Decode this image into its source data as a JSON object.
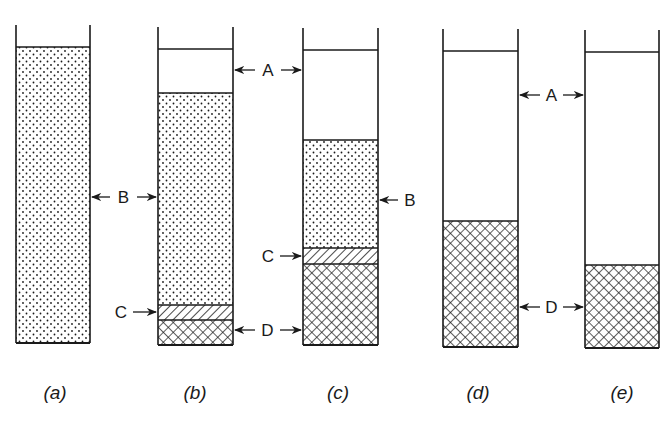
{
  "figure": {
    "colors": {
      "ink": "#1a1a1a",
      "background": "#ffffff"
    },
    "legend": {
      "A": "clear liquid",
      "B": "uniform suspension (dotted)",
      "C": "transition zone (diagonal hatch)",
      "D": "sediment / compacted layer (crosshatch)"
    },
    "columns": [
      {
        "caption": "(a)",
        "left": 16,
        "right": 90,
        "wall_top": 25,
        "liquid_top": 47,
        "bottom": 343,
        "layers": [
          {
            "zone": "B",
            "top": 47,
            "bottom": 343
          }
        ]
      },
      {
        "caption": "(b)",
        "left": 158,
        "right": 233,
        "wall_top": 27,
        "liquid_top": 49,
        "bottom": 345,
        "layers": [
          {
            "zone": "A",
            "top": 49,
            "bottom": 93
          },
          {
            "zone": "B",
            "top": 93,
            "bottom": 305
          },
          {
            "zone": "C",
            "top": 305,
            "bottom": 320
          },
          {
            "zone": "D",
            "top": 320,
            "bottom": 345
          }
        ]
      },
      {
        "caption": "(c)",
        "left": 303,
        "right": 378,
        "wall_top": 28,
        "liquid_top": 50,
        "bottom": 345,
        "layers": [
          {
            "zone": "A",
            "top": 50,
            "bottom": 140
          },
          {
            "zone": "B",
            "top": 140,
            "bottom": 248
          },
          {
            "zone": "C",
            "top": 248,
            "bottom": 264
          },
          {
            "zone": "D",
            "top": 264,
            "bottom": 345
          }
        ]
      },
      {
        "caption": "(d)",
        "left": 443,
        "right": 518,
        "wall_top": 29,
        "liquid_top": 51,
        "bottom": 347,
        "layers": [
          {
            "zone": "A",
            "top": 51,
            "bottom": 221
          },
          {
            "zone": "D",
            "top": 221,
            "bottom": 347
          }
        ]
      },
      {
        "caption": "(e)",
        "left": 585,
        "right": 659,
        "wall_top": 30,
        "liquid_top": 52,
        "bottom": 348,
        "layers": [
          {
            "zone": "A",
            "top": 52,
            "bottom": 265
          },
          {
            "zone": "D",
            "top": 265,
            "bottom": 348
          }
        ]
      }
    ],
    "annotations": [
      {
        "text": "B",
        "between": [
          "a",
          "b"
        ],
        "y": 197
      },
      {
        "text": "A",
        "between": [
          "b",
          "c"
        ],
        "y": 70
      },
      {
        "text": "C",
        "target": "b",
        "y": 312
      },
      {
        "text": "D",
        "between": [
          "b",
          "c"
        ],
        "y": 330
      },
      {
        "text": "B",
        "target": "c",
        "side": "right",
        "y": 200
      },
      {
        "text": "C",
        "target": "c",
        "y": 256
      },
      {
        "text": "A",
        "between": [
          "d",
          "e"
        ],
        "y": 95
      },
      {
        "text": "D",
        "between": [
          "d",
          "e"
        ],
        "y": 307
      }
    ],
    "captions": [
      "(a)",
      "(b)",
      "(c)",
      "(d)",
      "(e)"
    ]
  }
}
